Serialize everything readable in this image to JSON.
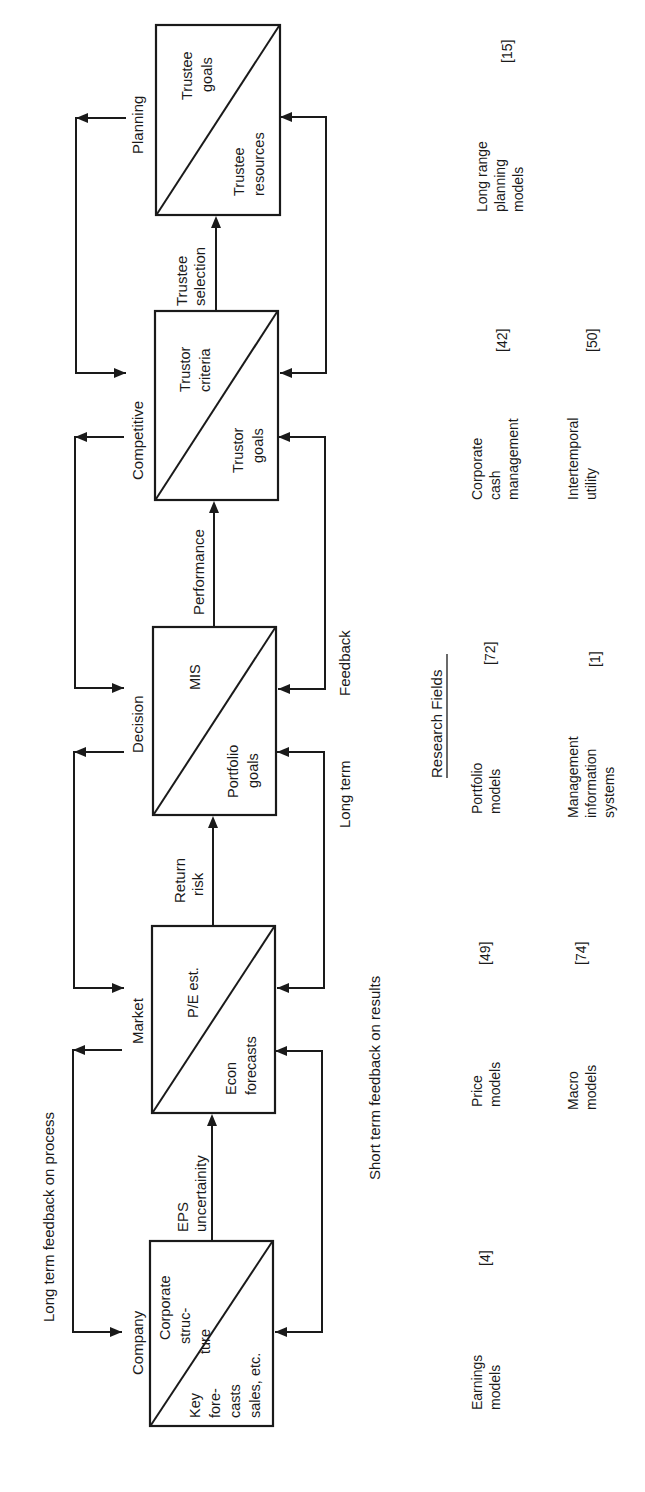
{
  "diagram": {
    "orientation": "rotated 90 degrees counter-clockwise",
    "top_label": "Long term feedback on process",
    "bottom_label": "Short term feedback on results",
    "stages": [
      {
        "name": "Company",
        "upper": [
          "Corporate",
          "struc-",
          "ture"
        ],
        "lower": [
          "Key",
          "fore-",
          "casts",
          "sales, etc."
        ]
      },
      {
        "name": "Market",
        "upper": [
          "P/E est."
        ],
        "lower": [
          "Econ",
          "forecasts"
        ]
      },
      {
        "name": "Decision",
        "upper": [
          "MIS"
        ],
        "lower": [
          "Portfolio",
          "goals"
        ]
      },
      {
        "name": "Competitive",
        "upper": [
          "Trustor",
          "criteria"
        ],
        "lower": [
          "Trustor",
          "goals"
        ]
      },
      {
        "name": "Planning",
        "upper": [
          "Trustee",
          "goals"
        ],
        "lower": [
          "Trustee",
          "resources"
        ]
      }
    ],
    "flows": [
      {
        "from": "Company",
        "to": "Market",
        "label": [
          "EPS",
          "uncertainity"
        ]
      },
      {
        "from": "Market",
        "to": "Decision",
        "label": [
          "Return",
          "risk"
        ]
      },
      {
        "from": "Decision",
        "to": "Competitive",
        "label": [
          "Performance"
        ]
      },
      {
        "from": "Competitive",
        "to": "Planning",
        "label": [
          "Trustee",
          "selection"
        ]
      }
    ],
    "feedback_labels": {
      "long_term": "Long term",
      "feedback": "Feedback"
    }
  },
  "research_fields": {
    "title": "Research Fields",
    "row1": [
      {
        "name": [
          "Earnings",
          "models"
        ],
        "ref": "[4]"
      },
      {
        "name": [
          "Price",
          "models"
        ],
        "ref": "[49]"
      },
      {
        "name": [
          "Portfolio",
          "models"
        ],
        "ref": "[72]"
      },
      {
        "name": [
          "Corporate",
          "cash",
          "management"
        ],
        "ref": "[42]"
      },
      {
        "name": [
          "Long range",
          "planning",
          "models"
        ],
        "ref": "[15]"
      }
    ],
    "row2": [
      {
        "name": [
          "Macro",
          "models"
        ],
        "ref": "[74]"
      },
      {
        "name": [
          "Management",
          "information",
          "systems"
        ],
        "ref": "[1]"
      },
      {
        "name": [
          "Intertemporal",
          "utility"
        ],
        "ref": "[50]"
      }
    ]
  }
}
